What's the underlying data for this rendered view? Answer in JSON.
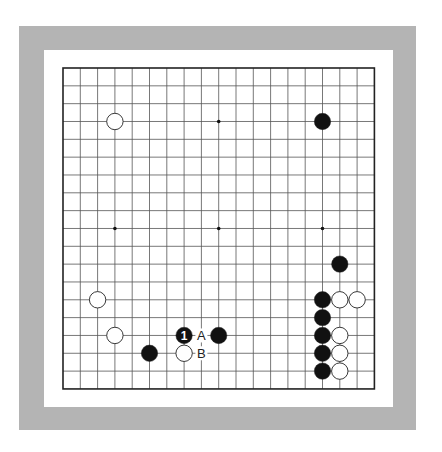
{
  "board": {
    "size": 19,
    "origin": [
      63,
      68
    ],
    "spacing": [
      17.3,
      17.83
    ],
    "colors": {
      "frame": "#b4b4b4",
      "inner": "#ffffff",
      "line": "#555555",
      "border": "#222222",
      "black": "#111111",
      "white": "#ffffff"
    },
    "star_points": [
      [
        3,
        3
      ],
      [
        9,
        3
      ],
      [
        15,
        3
      ],
      [
        3,
        9
      ],
      [
        9,
        9
      ],
      [
        15,
        9
      ],
      [
        3,
        15
      ],
      [
        9,
        15
      ],
      [
        15,
        15
      ]
    ],
    "stones": [
      {
        "color": "white",
        "col": 3,
        "row": 3
      },
      {
        "color": "black",
        "col": 15,
        "row": 3
      },
      {
        "color": "black",
        "col": 16,
        "row": 11
      },
      {
        "color": "white",
        "col": 2,
        "row": 13
      },
      {
        "color": "black",
        "col": 15,
        "row": 13
      },
      {
        "color": "white",
        "col": 16,
        "row": 13
      },
      {
        "color": "white",
        "col": 17,
        "row": 13
      },
      {
        "color": "black",
        "col": 15,
        "row": 14
      },
      {
        "color": "white",
        "col": 3,
        "row": 15
      },
      {
        "color": "black",
        "col": 7,
        "row": 15,
        "label": "1"
      },
      {
        "color": "black",
        "col": 9,
        "row": 15
      },
      {
        "color": "black",
        "col": 15,
        "row": 15
      },
      {
        "color": "white",
        "col": 16,
        "row": 15
      },
      {
        "color": "black",
        "col": 5,
        "row": 16
      },
      {
        "color": "white",
        "col": 7,
        "row": 16
      },
      {
        "color": "black",
        "col": 15,
        "row": 16
      },
      {
        "color": "white",
        "col": 16,
        "row": 16
      },
      {
        "color": "black",
        "col": 15,
        "row": 17
      },
      {
        "color": "white",
        "col": 16,
        "row": 17
      }
    ],
    "markers": [
      {
        "text": "A",
        "col": 8,
        "row": 15
      },
      {
        "text": "B",
        "col": 8,
        "row": 16
      }
    ]
  }
}
